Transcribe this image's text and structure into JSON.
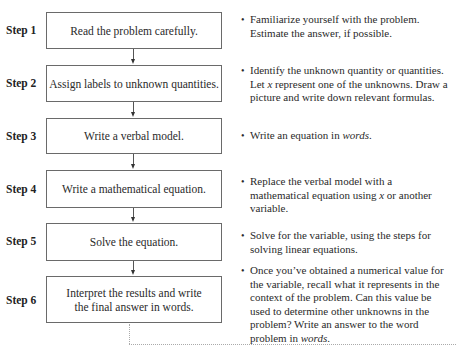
{
  "steps": [
    {
      "label": "Step 1",
      "box_text": "Read the problem carefully.",
      "note_parts": [
        "Familiarize yourself with the problem. Estimate the answer, if possible."
      ]
    },
    {
      "label": "Step 2",
      "box_text": "Assign labels to unknown quantities.",
      "note_parts": [
        "Identify the unknown quantity or quantities. Let ",
        "x",
        " represent one of the unknowns. Draw a picture and write down relevant formulas."
      ]
    },
    {
      "label": "Step 3",
      "box_text": "Write a verbal model.",
      "note_parts": [
        "Write an equation in ",
        "words",
        "."
      ]
    },
    {
      "label": "Step 4",
      "box_text": "Write a mathematical equation.",
      "note_parts": [
        "Replace the verbal model with a mathematical equation using ",
        "x",
        " or another variable."
      ]
    },
    {
      "label": "Step 5",
      "box_text": "Solve the equation.",
      "note_parts": [
        "Solve for the variable, using the steps for solving linear equations."
      ]
    },
    {
      "label": "Step 6",
      "box_text_line1": "Interpret the results and write",
      "box_text_line2": "the final answer in words.",
      "note_parts": [
        "Once you’ve obtained a numerical value for the variable, recall what it represents in the context of the problem. Can this value be used to determine other unknowns in the problem? Write an answer to the word problem in ",
        "words",
        "."
      ]
    }
  ],
  "bullet_glyph": "•",
  "colors": {
    "box_border": "#6a6a6a",
    "arrow": "#333333",
    "dotted_line": "#aaaaaa",
    "text": "#2a2a2a"
  }
}
